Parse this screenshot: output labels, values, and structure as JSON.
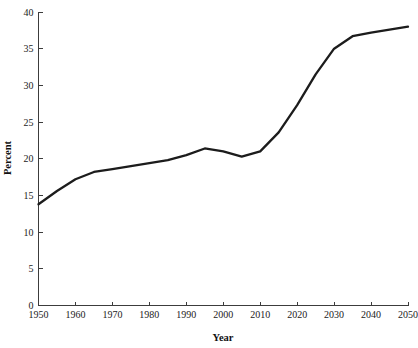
{
  "figure": {
    "caption_top": "",
    "caption_bottom": "",
    "line_color": "#1c1c1c",
    "axis_color": "#3c3c3c",
    "background_color": "#ffffff"
  },
  "chart_data": {
    "type": "line",
    "title": "",
    "xlabel": "Year",
    "ylabel": "Percent",
    "xlim": [
      1950,
      2050
    ],
    "ylim": [
      0,
      40
    ],
    "xticks": [
      1950,
      1960,
      1970,
      1980,
      1990,
      2000,
      2010,
      2020,
      2030,
      2040,
      2050
    ],
    "xtick_labels": [
      "1950",
      "1960",
      "1970",
      "1980",
      "1990",
      "2000",
      "2010",
      "2020",
      "2030",
      "2040",
      "2050"
    ],
    "yticks": [
      0,
      5,
      10,
      15,
      20,
      25,
      30,
      35,
      40
    ],
    "ytick_labels": [
      "0",
      "5",
      "10",
      "15",
      "20",
      "25",
      "30",
      "35",
      "40"
    ],
    "grid": false,
    "legend": false,
    "legend_position": "none",
    "series": [
      {
        "name": "Percent",
        "x": [
          1950,
          1955,
          1960,
          1965,
          1970,
          1975,
          1980,
          1985,
          1990,
          1995,
          2000,
          2005,
          2010,
          2015,
          2020,
          2025,
          2030,
          2035,
          2040,
          2045,
          2050
        ],
        "values": [
          13.8,
          15.6,
          17.2,
          18.2,
          18.6,
          19.0,
          19.4,
          19.8,
          20.5,
          21.4,
          21.0,
          20.3,
          21.0,
          23.6,
          27.3,
          31.5,
          35.0,
          36.7,
          37.2,
          37.6,
          38.0
        ]
      }
    ]
  }
}
